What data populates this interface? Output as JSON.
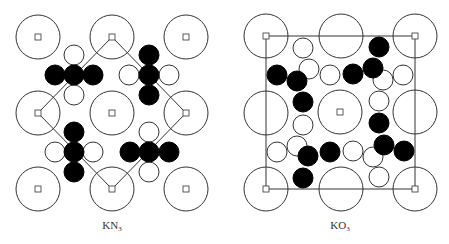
{
  "colors": {
    "stroke": "#333333",
    "fill_dark": "#000000",
    "fill_light": "#ffffff",
    "label": "#333333"
  },
  "panels": [
    {
      "id": "kn3",
      "label_main": "KN",
      "label_sub": "3",
      "label_x": 112,
      "cell_outline": {
        "type": "polygon",
        "points": [
          [
            112,
            37
          ],
          [
            186,
            113
          ],
          [
            112,
            189
          ],
          [
            38,
            113
          ]
        ]
      },
      "large_atoms": [
        {
          "cx": 38,
          "cy": 37,
          "marker": true
        },
        {
          "cx": 112,
          "cy": 37,
          "marker": true
        },
        {
          "cx": 186,
          "cy": 37,
          "marker": true
        },
        {
          "cx": 38,
          "cy": 113,
          "marker": true
        },
        {
          "cx": 112,
          "cy": 113,
          "marker": true
        },
        {
          "cx": 186,
          "cy": 113,
          "marker": true
        },
        {
          "cx": 38,
          "cy": 189,
          "marker": true
        },
        {
          "cx": 112,
          "cy": 189,
          "marker": true
        },
        {
          "cx": 186,
          "cy": 189,
          "marker": true
        }
      ],
      "dark_atoms": [
        {
          "cx": 55,
          "cy": 75
        },
        {
          "cx": 74,
          "cy": 75
        },
        {
          "cx": 93,
          "cy": 75
        },
        {
          "cx": 149,
          "cy": 55
        },
        {
          "cx": 149,
          "cy": 75
        },
        {
          "cx": 149,
          "cy": 95
        },
        {
          "cx": 74,
          "cy": 132
        },
        {
          "cx": 74,
          "cy": 152
        },
        {
          "cx": 74,
          "cy": 172
        },
        {
          "cx": 130,
          "cy": 152
        },
        {
          "cx": 149,
          "cy": 152
        },
        {
          "cx": 169,
          "cy": 152
        }
      ],
      "light_atoms": [
        {
          "cx": 74,
          "cy": 55
        },
        {
          "cx": 74,
          "cy": 95
        },
        {
          "cx": 129,
          "cy": 75
        },
        {
          "cx": 169,
          "cy": 75
        },
        {
          "cx": 55,
          "cy": 152
        },
        {
          "cx": 93,
          "cy": 152
        },
        {
          "cx": 149,
          "cy": 132
        },
        {
          "cx": 149,
          "cy": 172
        }
      ]
    },
    {
      "id": "ko3",
      "label_main": "KO",
      "label_sub": "3",
      "label_x": 340,
      "cell_outline": {
        "type": "polygon",
        "points": [
          [
            266,
            36
          ],
          [
            415,
            36
          ],
          [
            415,
            189
          ],
          [
            266,
            189
          ]
        ]
      },
      "large_atoms": [
        {
          "cx": 266,
          "cy": 36,
          "marker": true
        },
        {
          "cx": 341,
          "cy": 36,
          "marker": false
        },
        {
          "cx": 415,
          "cy": 36,
          "marker": true
        },
        {
          "cx": 266,
          "cy": 113,
          "marker": false
        },
        {
          "cx": 340,
          "cy": 112,
          "marker": true
        },
        {
          "cx": 415,
          "cy": 112,
          "marker": false
        },
        {
          "cx": 266,
          "cy": 189,
          "marker": true
        },
        {
          "cx": 341,
          "cy": 189,
          "marker": false
        },
        {
          "cx": 415,
          "cy": 189,
          "marker": true
        }
      ],
      "dark_atoms": [
        {
          "cx": 277,
          "cy": 75
        },
        {
          "cx": 297,
          "cy": 81
        },
        {
          "cx": 303,
          "cy": 102
        },
        {
          "cx": 353,
          "cy": 74
        },
        {
          "cx": 373,
          "cy": 68
        },
        {
          "cx": 379,
          "cy": 47
        },
        {
          "cx": 308,
          "cy": 156
        },
        {
          "cx": 330,
          "cy": 152
        },
        {
          "cx": 303,
          "cy": 178
        },
        {
          "cx": 379,
          "cy": 123
        },
        {
          "cx": 384,
          "cy": 145
        },
        {
          "cx": 404,
          "cy": 151
        }
      ],
      "light_atoms": [
        {
          "cx": 303,
          "cy": 48
        },
        {
          "cx": 309,
          "cy": 69
        },
        {
          "cx": 330,
          "cy": 75
        },
        {
          "cx": 383,
          "cy": 80
        },
        {
          "cx": 403,
          "cy": 75
        },
        {
          "cx": 379,
          "cy": 101
        },
        {
          "cx": 303,
          "cy": 125
        },
        {
          "cx": 277,
          "cy": 152
        },
        {
          "cx": 297,
          "cy": 146
        },
        {
          "cx": 353,
          "cy": 151
        },
        {
          "cx": 373,
          "cy": 157
        },
        {
          "cx": 379,
          "cy": 177
        }
      ]
    }
  ],
  "radii": {
    "large": 22,
    "small": 10,
    "marker": 3
  }
}
